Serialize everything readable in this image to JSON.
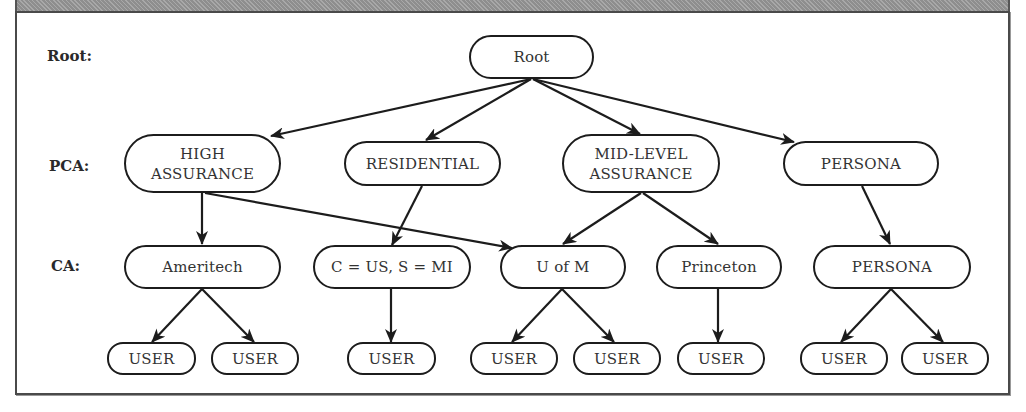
{
  "row_labels": {
    "root": "Root:",
    "pca": "PCA:",
    "ca": "CA:"
  },
  "nodes": {
    "root": "Root",
    "pca_high": "HIGH\nASSURANCE",
    "pca_residential": "RESIDENTIAL",
    "pca_midlevel": "MID-LEVEL\nASSURANCE",
    "pca_persona": "PERSONA",
    "ca_ameritech": "Ameritech",
    "ca_cus": "C = US, S = MI",
    "ca_uofm": "U of M",
    "ca_princeton": "Princeton",
    "ca_persona": "PERSONA",
    "user_1": "USER",
    "user_2": "USER",
    "user_3": "USER",
    "user_4": "USER",
    "user_5": "USER",
    "user_6": "USER",
    "user_7": "USER",
    "user_8": "USER"
  },
  "edges": [
    {
      "from": "Root",
      "to": "HIGH ASSURANCE"
    },
    {
      "from": "Root",
      "to": "RESIDENTIAL"
    },
    {
      "from": "Root",
      "to": "MID-LEVEL ASSURANCE"
    },
    {
      "from": "Root",
      "to": "PERSONA (PCA)"
    },
    {
      "from": "HIGH ASSURANCE",
      "to": "Ameritech"
    },
    {
      "from": "HIGH ASSURANCE",
      "to": "U of M"
    },
    {
      "from": "RESIDENTIAL",
      "to": "C = US, S = MI"
    },
    {
      "from": "MID-LEVEL ASSURANCE",
      "to": "U of M"
    },
    {
      "from": "MID-LEVEL ASSURANCE",
      "to": "Princeton"
    },
    {
      "from": "PERSONA (PCA)",
      "to": "PERSONA (CA)"
    },
    {
      "from": "Ameritech",
      "to": "USER"
    },
    {
      "from": "Ameritech",
      "to": "USER"
    },
    {
      "from": "C = US, S = MI",
      "to": "USER"
    },
    {
      "from": "U of M",
      "to": "USER"
    },
    {
      "from": "U of M",
      "to": "USER"
    },
    {
      "from": "Princeton",
      "to": "USER"
    },
    {
      "from": "PERSONA (CA)",
      "to": "USER"
    },
    {
      "from": "PERSONA (CA)",
      "to": "USER"
    }
  ],
  "colors": {
    "line": "#1c1c1c",
    "band": "#9a9a9a",
    "frame": "#4a4a4a"
  }
}
